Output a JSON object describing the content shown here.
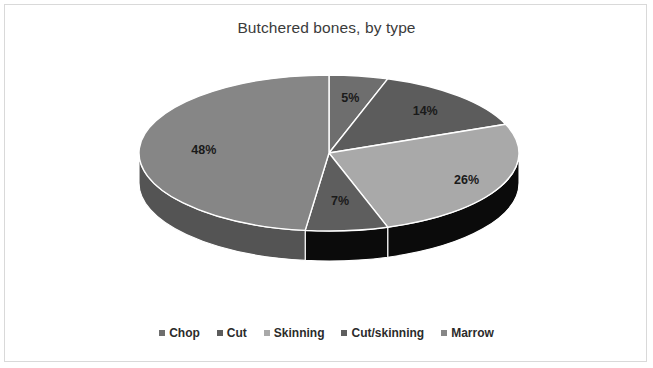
{
  "frame": {
    "border_color": "#d9d9d9",
    "background": "#ffffff"
  },
  "chart_data": {
    "type": "pie",
    "title": "Butchered bones, by type",
    "three_d": true,
    "start_angle_deg": 0,
    "direction": "clockwise",
    "categories": [
      "Chop",
      "Cut",
      "Skinning",
      "Cut/skinning",
      "Marrow"
    ],
    "values": [
      5,
      14,
      26,
      7,
      48
    ],
    "value_labels": [
      "5%",
      "14%",
      "26%",
      "7%",
      "48%"
    ],
    "unit": "%",
    "legend_position": "bottom",
    "slice_colors": [
      "#6e6e6e",
      "#5c5c5c",
      "#a9a9a9",
      "#5e5e5e",
      "#868686"
    ],
    "side_colors": [
      "#3f3f3f",
      "#0b0b0b",
      "#0b0b0b",
      "#0b0b0b",
      "#545454"
    ],
    "separator_color": "#ffffff",
    "label_color": "#1a1a1a",
    "title_color": "#3b3b3b",
    "slices": [
      {
        "name": "Chop",
        "value": 5,
        "label": "5%",
        "color": "#6e6e6e",
        "side_color": "#3f3f3f"
      },
      {
        "name": "Cut",
        "value": 14,
        "label": "14%",
        "color": "#5c5c5c",
        "side_color": "#0b0b0b"
      },
      {
        "name": "Skinning",
        "value": 26,
        "label": "26%",
        "color": "#a9a9a9",
        "side_color": "#0b0b0b"
      },
      {
        "name": "Cut/skinning",
        "value": 7,
        "label": "7%",
        "color": "#5e5e5e",
        "side_color": "#0b0b0b"
      },
      {
        "name": "Marrow",
        "value": 48,
        "label": "48%",
        "color": "#868686",
        "side_color": "#545454"
      }
    ]
  },
  "legend": {
    "items": [
      {
        "label": "Chop",
        "color": "#6e6e6e"
      },
      {
        "label": "Cut",
        "color": "#5c5c5c"
      },
      {
        "label": "Skinning",
        "color": "#a9a9a9"
      },
      {
        "label": "Cut/skinning",
        "color": "#5e5e5e"
      },
      {
        "label": "Marrow",
        "color": "#868686"
      }
    ]
  }
}
